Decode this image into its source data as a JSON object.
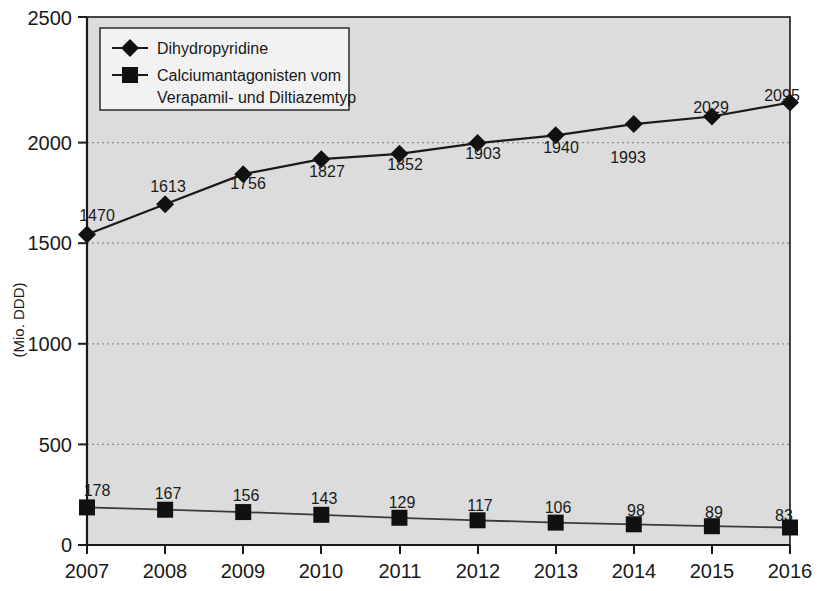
{
  "chart_data": {
    "type": "line",
    "title": "",
    "subtitle": "",
    "xlabel": "",
    "ylabel": "(Mio. DDD)",
    "categories": [
      "2007",
      "2008",
      "2009",
      "2010",
      "2011",
      "2012",
      "2013",
      "2014",
      "2015",
      "2016"
    ],
    "x": [
      2007,
      2008,
      2009,
      2010,
      2011,
      2012,
      2013,
      2014,
      2015,
      2016
    ],
    "xlim": [
      2007,
      2016
    ],
    "ylim": [
      0,
      2500
    ],
    "y_ticks": [
      "0",
      "500",
      "1000",
      "1500",
      "2000",
      "2500"
    ],
    "y_tick_values": [
      0,
      500,
      1000,
      1500,
      2000,
      2500
    ],
    "grid": "horizontal-dotted",
    "legend_position": "top-left-inside",
    "plot_background": "#dcdcdc",
    "series": [
      {
        "name": "Dihydropyridine",
        "marker": "diamond",
        "color": "#111111",
        "label_position": "above",
        "values": [
          1470,
          1613,
          1756,
          1827,
          1852,
          1903,
          1940,
          1993,
          2029,
          2095
        ],
        "point_labels": [
          "1470",
          "1613",
          "1756",
          "1827",
          "1852",
          "1903",
          "1940",
          "1993",
          "2029",
          "2095"
        ]
      },
      {
        "name": "Calciumantagonisten vom Verapamil- und Diltiazemtyp",
        "marker": "square",
        "color": "#111111",
        "label_position": "above",
        "values": [
          178,
          167,
          156,
          143,
          129,
          117,
          106,
          98,
          89,
          83
        ],
        "point_labels": [
          "178",
          "167",
          "156",
          "143",
          "129",
          "117",
          "106",
          "98",
          "89",
          "83"
        ]
      }
    ]
  },
  "legend": {
    "entries": [
      {
        "label": "Dihydropyridine",
        "marker": "diamond"
      },
      {
        "label_line1": "Calciumantagonisten vom",
        "label_line2": "Verapamil- und Diltiazemtyp",
        "marker": "square"
      }
    ]
  },
  "axes": {
    "y_title": "(Mio. DDD)",
    "y_tick_0": "0",
    "y_tick_500": "500",
    "y_tick_1000": "1000",
    "y_tick_1500": "1500",
    "y_tick_2000": "2000",
    "y_tick_2500": "2500",
    "x_tick_2007": "2007",
    "x_tick_2008": "2008",
    "x_tick_2009": "2009",
    "x_tick_2010": "2010",
    "x_tick_2011": "2011",
    "x_tick_2012": "2012",
    "x_tick_2013": "2013",
    "x_tick_2014": "2014",
    "x_tick_2015": "2015",
    "x_tick_2016": "2016"
  },
  "series1_labels": {
    "p0": "1470",
    "p1": "1613",
    "p2": "1756",
    "p3": "1827",
    "p4": "1852",
    "p5": "1903",
    "p6": "1940",
    "p7": "1993",
    "p8": "2029",
    "p9": "2095"
  },
  "series2_labels": {
    "p0": "178",
    "p1": "167",
    "p2": "156",
    "p3": "143",
    "p4": "129",
    "p5": "117",
    "p6": "106",
    "p7": "98",
    "p8": "89",
    "p9": "83"
  }
}
